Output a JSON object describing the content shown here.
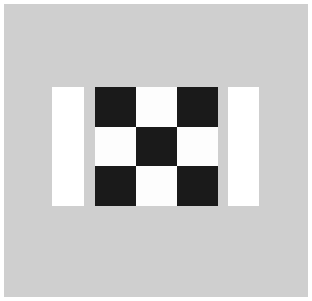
{
  "canvas": {
    "width": 312,
    "height": 301,
    "background_color": "#ffffff",
    "border_color": "#ffffff",
    "border_width": 4
  },
  "field": {
    "label": "gray-background-field",
    "color": "#cfcfcf",
    "x": 4,
    "y": 4,
    "width": 304,
    "height": 293
  },
  "chart_data": {
    "type": "heatmap",
    "title": "",
    "subtitle": "",
    "xlabel": "",
    "ylabel": "",
    "grid": false,
    "legend": false,
    "colors": {
      "black": "#1a1a1a",
      "white": "#fdfdfd",
      "gray": "#cfcfcf"
    },
    "rows": 3,
    "cols": 3,
    "x": [
      "c1",
      "c2",
      "c3"
    ],
    "categories": [
      "r1",
      "r2",
      "r3"
    ],
    "values": [
      [
        1,
        0,
        1
      ],
      [
        0,
        1,
        0
      ],
      [
        1,
        0,
        1
      ]
    ],
    "value_labels": {
      "1": "black",
      "0": "white"
    },
    "series": [
      {
        "name": "row-1",
        "values": [
          1,
          0,
          1
        ]
      },
      {
        "name": "row-2",
        "values": [
          0,
          1,
          0
        ]
      },
      {
        "name": "row-3",
        "values": [
          1,
          0,
          1
        ]
      }
    ]
  },
  "checkerboard": {
    "label": "checkerboard",
    "x": 95,
    "y": 87,
    "width": 123,
    "height": 119,
    "cell_width": 41,
    "cell_height": 39.67,
    "cells": [
      {
        "name": "cell-r1c1",
        "tone": "black"
      },
      {
        "name": "cell-r1c2",
        "tone": "white"
      },
      {
        "name": "cell-r1c3",
        "tone": "black"
      },
      {
        "name": "cell-r2c1",
        "tone": "white"
      },
      {
        "name": "cell-r2c2",
        "tone": "black"
      },
      {
        "name": "cell-r2c3",
        "tone": "white"
      },
      {
        "name": "cell-r3c1",
        "tone": "black"
      },
      {
        "name": "cell-r3c2",
        "tone": "white"
      },
      {
        "name": "cell-r3c3",
        "tone": "black"
      }
    ]
  },
  "bars": [
    {
      "name": "left-white-bar",
      "color": "#ffffff",
      "x": 52,
      "y": 87,
      "width": 32,
      "height": 119
    },
    {
      "name": "right-white-bar",
      "color": "#ffffff",
      "x": 228,
      "y": 87,
      "width": 31,
      "height": 119
    }
  ]
}
